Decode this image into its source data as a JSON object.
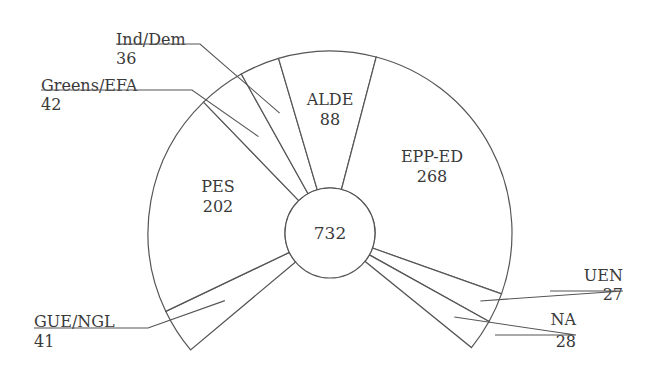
{
  "chart_data": {
    "type": "pie",
    "subtype": "parliament-arc (doughnut, 259-degree span, gap at bottom)",
    "title": "",
    "total": 732,
    "center_label": "732",
    "categories": [
      "GUE/NGL",
      "PES",
      "Greens/EFA",
      "Ind/Dem",
      "ALDE",
      "EPP-ED",
      "UEN",
      "NA"
    ],
    "values": [
      41,
      202,
      42,
      36,
      88,
      268,
      27,
      28
    ],
    "labels": [
      {
        "name": "GUE/NGL",
        "value": "41",
        "placement": "outside-left-callout"
      },
      {
        "name": "PES",
        "value": "202",
        "placement": "inside"
      },
      {
        "name": "Greens/EFA",
        "value": "42",
        "placement": "outside-left-callout"
      },
      {
        "name": "Ind/Dem",
        "value": "36",
        "placement": "outside-left-callout"
      },
      {
        "name": "ALDE",
        "value": "88",
        "placement": "inside"
      },
      {
        "name": "EPP-ED",
        "value": "268",
        "placement": "inside"
      },
      {
        "name": "UEN",
        "value": "27",
        "placement": "outside-right-callout"
      },
      {
        "name": "NA",
        "value": "28",
        "placement": "outside-right-callout"
      }
    ],
    "colors": {
      "line": "#555555",
      "fill": "#ffffff",
      "text": "#3a3a3a"
    }
  },
  "geometry": {
    "cx": 330,
    "cy": 233,
    "r_inner": 45,
    "r_outer": 182,
    "start_deg": 220,
    "span_deg": 259
  }
}
